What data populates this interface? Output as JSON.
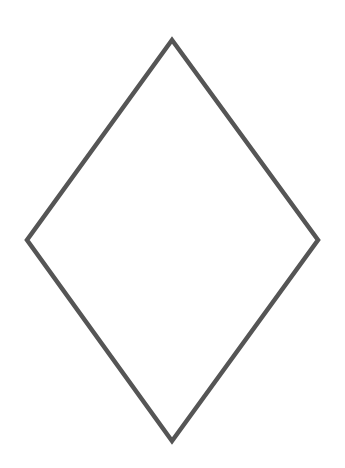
{
  "diagram": {
    "shape": "rhombus",
    "vertices": {
      "top": [
        172,
        40
      ],
      "right": [
        318,
        240
      ],
      "bottom": [
        172,
        441
      ],
      "left": [
        27,
        240
      ]
    },
    "stroke_color": "#555555",
    "stroke_width": 4.5,
    "fill_color": "#ffffff",
    "background": "#ffffff"
  }
}
